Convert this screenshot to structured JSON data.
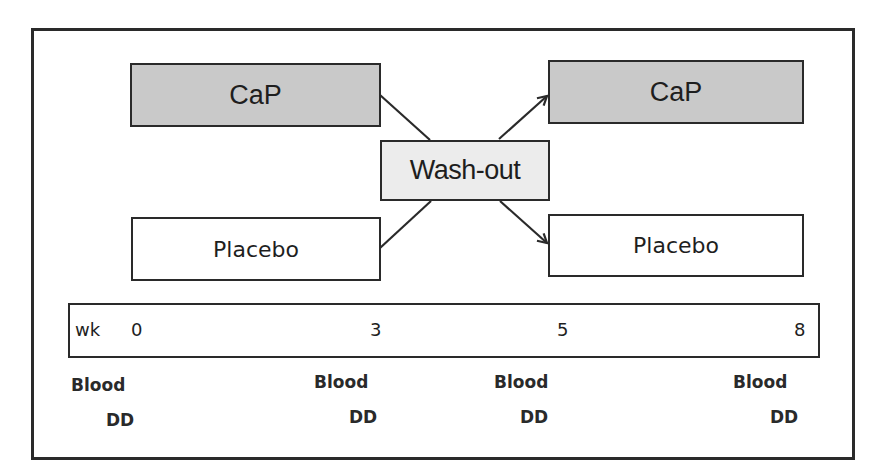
{
  "diagram": {
    "arms": {
      "left_top": {
        "label": "CaP",
        "fill": "#c9c9c9"
      },
      "left_bottom": {
        "label": "Placebo",
        "fill": "#ffffff"
      },
      "right_top": {
        "label": "CaP",
        "fill": "#c9c9c9"
      },
      "right_bottom": {
        "label": "Placebo",
        "fill": "#ffffff"
      }
    },
    "washout": {
      "label": "Wash-out",
      "fill": "#ececec"
    },
    "timeline": {
      "unit_label": "wk",
      "ticks": [
        "0",
        "3",
        "5",
        "8"
      ]
    },
    "measurements": [
      {
        "week": "0",
        "line1": "Blood",
        "line2": "DD"
      },
      {
        "week": "3",
        "line1": "Blood",
        "line2": "DD"
      },
      {
        "week": "5",
        "line1": "Blood",
        "line2": "DD"
      },
      {
        "week": "8",
        "line1": "Blood",
        "line2": "DD"
      }
    ],
    "connections": [
      {
        "from": "CaP (left)",
        "to": "Wash-out",
        "arrow": false
      },
      {
        "from": "Placebo (left)",
        "to": "Wash-out",
        "arrow": false
      },
      {
        "from": "Wash-out",
        "to": "CaP (right)",
        "arrow": true
      },
      {
        "from": "Wash-out",
        "to": "Placebo (right)",
        "arrow": true
      }
    ]
  }
}
